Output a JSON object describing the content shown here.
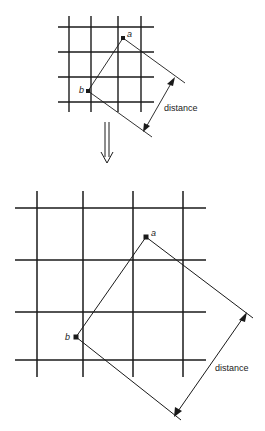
{
  "top_figure": {
    "point_a_label": "a",
    "point_b_label": "b",
    "distance_label": "distance"
  },
  "transition": {
    "arrow": "double-down-arrow-icon"
  },
  "bottom_figure": {
    "point_a_label": "a",
    "point_b_label": "b",
    "distance_label": "distance"
  },
  "colors": {
    "line": "#1a1a1a",
    "background": "#ffffff"
  }
}
